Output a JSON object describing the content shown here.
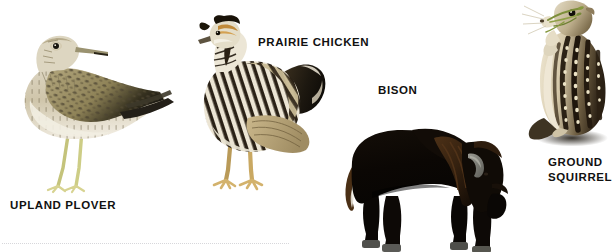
{
  "page": {
    "background_color": "#ffffff",
    "type": "illustrated-species-plate",
    "caption_color": "#111111"
  },
  "figures": [
    {
      "key": "upland-plover",
      "label": "UPLAND PLOVER",
      "label_lines": [
        "UPLAND PLOVER"
      ],
      "subject": "bird",
      "palette": {
        "body_light": "#e6e0cf",
        "body_mid": "#b9ab86",
        "mottle_dark": "#4a4230",
        "wing_dark": "#2a2720",
        "leg": "#c9c87e",
        "bill": "#8f8a63",
        "eye": "#19160f"
      }
    },
    {
      "key": "prairie-chicken",
      "label": "PRAIRIE CHICKEN",
      "label_lines": [
        "PRAIRIE CHICKEN"
      ],
      "subject": "bird",
      "palette": {
        "bar_dark": "#2b2216",
        "bar_light": "#efe9da",
        "body_tan": "#b9a274",
        "crown": "#171309",
        "face_rust": "#c08a3a",
        "leg": "#c6a055",
        "breast": "#d8d2c2"
      }
    },
    {
      "key": "bison",
      "label": "BISON",
      "label_lines": [
        "BISON"
      ],
      "subject": "mammal",
      "palette": {
        "body_black": "#0d0906",
        "mane_brown": "#3b2512",
        "tail_brown": "#4a2f15",
        "horn_gray": "#7e7e78",
        "hoof_gray": "#5a5a57"
      }
    },
    {
      "key": "ground-squirrel",
      "label": "GROUND SQUIRREL",
      "label_lines": [
        "GROUND",
        "SQUIRREL"
      ],
      "subject": "mammal",
      "palette": {
        "fur_light": "#d8cdb2",
        "fur_belly": "#eee6d2",
        "stripe_dark": "#261c10",
        "spot_cream": "#ece3c8",
        "eye": "#120f0a",
        "grass_green": "#7d8f3a",
        "shadow": "#3a332a"
      }
    }
  ],
  "decor": {
    "dotted_rule": "faint dotted horizontal rule"
  }
}
